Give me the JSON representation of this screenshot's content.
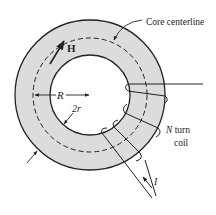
{
  "figure": {
    "type": "toroidal core with N-turn coil",
    "colors": {
      "core_fill": "#dcdcdc",
      "stroke": "#222222",
      "background": "#ffffff"
    }
  },
  "labels": {
    "core_centerline": "Core centerline",
    "field": "H",
    "major_radius": "R",
    "minor_diameter": "2r",
    "coil_line1": "N",
    "coil_line1_rest": " turn",
    "coil_line2": "coil",
    "current": "I"
  },
  "geometry": {
    "center": [
      90,
      95
    ],
    "outer_radius": 75,
    "inner_radius": 40,
    "centerline_radius": 57
  }
}
